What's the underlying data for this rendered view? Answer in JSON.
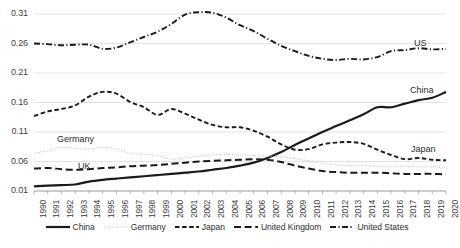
{
  "chart_data": {
    "type": "line",
    "title": "",
    "xlabel": "",
    "ylabel": "",
    "grid": true,
    "legend_position": "bottom",
    "x": [
      1990,
      1991,
      1992,
      1993,
      1994,
      1995,
      1996,
      1997,
      1998,
      1999,
      2000,
      2001,
      2002,
      2003,
      2004,
      2005,
      2006,
      2007,
      2008,
      2009,
      2010,
      2011,
      2012,
      2013,
      2014,
      2015,
      2016,
      2017,
      2018,
      2019,
      2020
    ],
    "xlim": [
      1990,
      2020
    ],
    "ylim": [
      0.01,
      0.31
    ],
    "yticks": [
      "0.01",
      "0.06",
      "0.11",
      "0.16",
      "0.21",
      "0.26",
      "0.31"
    ],
    "ytick_values": [
      0.01,
      0.06,
      0.11,
      0.16,
      0.21,
      0.26,
      0.31
    ],
    "xticks": [
      "1990",
      "1991",
      "1992",
      "1993",
      "1994",
      "1995",
      "1996",
      "1997",
      "1998",
      "1999",
      "2000",
      "2001",
      "2002",
      "2003",
      "2004",
      "2005",
      "2006",
      "2007",
      "2008",
      "2009",
      "2010",
      "2011",
      "2012",
      "2013",
      "2014",
      "2015",
      "2016",
      "2017",
      "2018",
      "2019",
      "2020"
    ],
    "series": [
      {
        "name": "China",
        "style": "solid",
        "color": "#1a1a1a",
        "width": 2.2,
        "values": [
          0.018,
          0.019,
          0.02,
          0.021,
          0.026,
          0.029,
          0.031,
          0.033,
          0.035,
          0.037,
          0.039,
          0.041,
          0.043,
          0.046,
          0.049,
          0.053,
          0.058,
          0.066,
          0.076,
          0.088,
          0.099,
          0.11,
          0.12,
          0.13,
          0.14,
          0.152,
          0.152,
          0.158,
          0.164,
          0.168,
          0.178
        ]
      },
      {
        "name": "Germany",
        "style": "dotted",
        "color": "#b8b8b8",
        "width": 1.0,
        "values": [
          0.074,
          0.078,
          0.084,
          0.082,
          0.081,
          0.084,
          0.081,
          0.074,
          0.072,
          0.07,
          0.064,
          0.066,
          0.069,
          0.071,
          0.072,
          0.071,
          0.07,
          0.069,
          0.068,
          0.065,
          0.061,
          0.057,
          0.054,
          0.053,
          0.053,
          0.052,
          0.052,
          0.052,
          0.051,
          0.051,
          0.05
        ]
      },
      {
        "name": "Japan",
        "style": "dashed",
        "color": "#1a1a1a",
        "width": 1.9,
        "values": [
          0.137,
          0.145,
          0.149,
          0.155,
          0.17,
          0.178,
          0.175,
          0.161,
          0.152,
          0.139,
          0.149,
          0.141,
          0.131,
          0.122,
          0.118,
          0.118,
          0.112,
          0.102,
          0.089,
          0.08,
          0.081,
          0.089,
          0.092,
          0.093,
          0.09,
          0.08,
          0.071,
          0.064,
          0.066,
          0.063,
          0.062
        ]
      },
      {
        "name": "United Kingdom",
        "style": "longdash",
        "color": "#1a1a1a",
        "width": 2.0,
        "values": [
          0.048,
          0.049,
          0.047,
          0.046,
          0.047,
          0.049,
          0.05,
          0.052,
          0.053,
          0.054,
          0.056,
          0.058,
          0.06,
          0.061,
          0.062,
          0.063,
          0.064,
          0.063,
          0.059,
          0.053,
          0.048,
          0.044,
          0.042,
          0.041,
          0.041,
          0.041,
          0.04,
          0.039,
          0.039,
          0.039,
          0.038
        ]
      },
      {
        "name": "United States",
        "style": "dashdot",
        "color": "#1a1a1a",
        "width": 1.9,
        "values": [
          0.26,
          0.259,
          0.257,
          0.258,
          0.258,
          0.251,
          0.253,
          0.262,
          0.271,
          0.28,
          0.293,
          0.309,
          0.313,
          0.312,
          0.304,
          0.291,
          0.281,
          0.268,
          0.256,
          0.247,
          0.239,
          0.234,
          0.232,
          0.234,
          0.233,
          0.237,
          0.247,
          0.249,
          0.252,
          0.25,
          0.251
        ]
      }
    ],
    "annotations": [
      {
        "text": "US",
        "series": "United States",
        "x": 414,
        "y": 38
      },
      {
        "text": "China",
        "series": "China",
        "x": 410,
        "y": 85
      },
      {
        "text": "Japan",
        "series": "Japan",
        "x": 411,
        "y": 144
      },
      {
        "text": "Germany",
        "series": "Germany",
        "x": 57,
        "y": 134
      },
      {
        "text": "UK",
        "series": "United Kingdom",
        "x": 78,
        "y": 161
      }
    ],
    "legend": [
      {
        "label": "China",
        "style": "solid"
      },
      {
        "label": "Germany",
        "style": "dotted"
      },
      {
        "label": "Japan",
        "style": "dashed"
      },
      {
        "label": "United Kingdom",
        "style": "longdash"
      },
      {
        "label": "United States",
        "style": "dashdot"
      }
    ]
  }
}
